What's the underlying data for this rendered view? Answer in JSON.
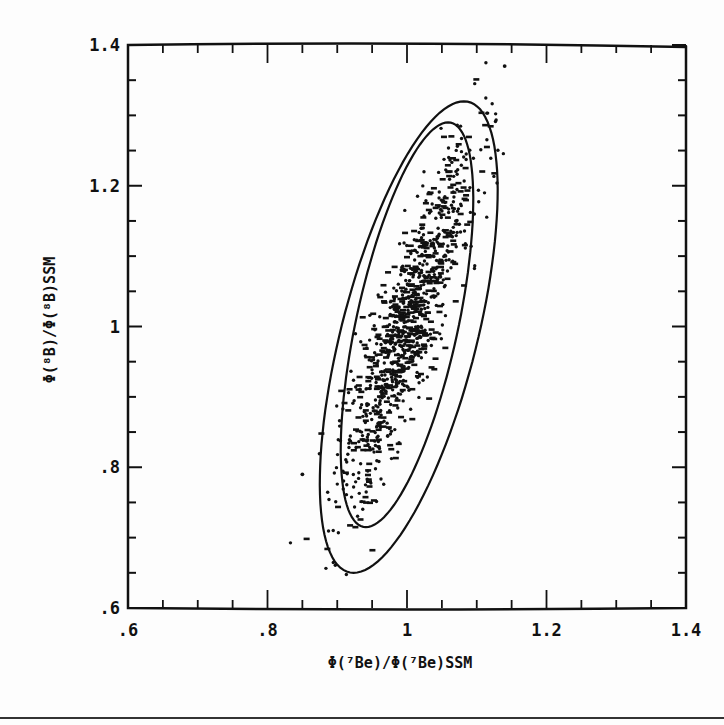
{
  "chart_data": {
    "type": "scatter",
    "title": "",
    "xlabel": "Φ(⁷Be)/Φ(⁷Be)SSM",
    "ylabel": "Φ(⁸B)/Φ(⁸B)SSM",
    "xlim": [
      0.6,
      1.4
    ],
    "ylim": [
      0.6,
      1.4
    ],
    "x_ticks": [
      ".6",
      ".8",
      "1",
      "1.2",
      "1.4"
    ],
    "y_ticks": [
      ".6",
      ".8",
      "1",
      "1.2",
      "1.4"
    ],
    "x_tick_values": [
      0.6,
      0.8,
      1.0,
      1.2,
      1.4
    ],
    "y_tick_values": [
      0.6,
      0.8,
      1.0,
      1.2,
      1.4
    ],
    "minor_tick_step": 0.05,
    "grid": false,
    "legend": null,
    "ellipses": [
      {
        "name": "inner contour",
        "center": [
          1.0,
          1.0
        ],
        "x_extent": [
          0.905,
          1.095
        ],
        "y_extent": [
          0.715,
          1.29
        ]
      },
      {
        "name": "outer contour",
        "center": [
          1.0,
          0.985
        ],
        "x_extent": [
          0.875,
          1.13
        ],
        "y_extent": [
          0.65,
          1.32
        ]
      }
    ],
    "scatter_summary": {
      "n_points": 1000,
      "mean": [
        1.0,
        1.0
      ],
      "sd_x": 0.048,
      "sd_y": 0.125,
      "correlation": 0.87,
      "notable_outliers": [
        [
          0.85,
          0.79
        ],
        [
          1.14,
          1.37
        ]
      ]
    }
  }
}
